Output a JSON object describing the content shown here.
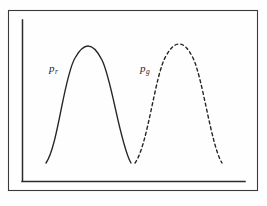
{
  "figure": {
    "background_color": "#fefefe",
    "stroke_color": "#262626",
    "frame_color": "#3a3a3a",
    "axis_color": "#2b2b2b",
    "width": 267,
    "height": 206
  },
  "labels": {
    "p_real": {
      "base": "p",
      "subscript": "r",
      "full": "pr"
    },
    "p_generated": {
      "base": "p",
      "subscript": "g",
      "full": "pg"
    }
  },
  "chart_data": {
    "type": "line",
    "title": "",
    "xlabel": "",
    "ylabel": "",
    "grid": false,
    "legend_position": "inline-annotation",
    "xlim": [
      0,
      267
    ],
    "ylim": [
      0,
      206
    ],
    "axes": {
      "y_axis": {
        "x": 22,
        "y_top": 20,
        "y_bottom": 181
      },
      "x_axis": {
        "y": 181,
        "x_left": 22,
        "x_right": 245
      },
      "outer_frame": {
        "x": 8,
        "y": 10,
        "width": 249,
        "height": 180
      }
    },
    "series": [
      {
        "name": "pr",
        "label": "pr",
        "style": "solid",
        "color": "#262626",
        "linewidth": 1.4,
        "baseline_y": 163,
        "peak": {
          "x": 88,
          "y": 49
        },
        "start": {
          "x": 46,
          "y": 163
        },
        "end": {
          "x": 131,
          "y": 163
        },
        "path": "M 46 163 C 58 146 64 76 75 58 C 80 49 84 46 88 46 C 93 46 97 50 102 60 C 112 80 120 144 131 163"
      },
      {
        "name": "pg",
        "label": "pg",
        "style": "dashed",
        "color": "#262626",
        "linewidth": 1.4,
        "dash_pattern": "3 3",
        "baseline_y": 163,
        "peak": {
          "x": 178,
          "y": 47
        },
        "start": {
          "x": 135,
          "y": 163
        },
        "end": {
          "x": 222,
          "y": 163
        },
        "path": "M 135 163 C 148 145 155 74 166 56 C 171 47 175 44 179 44 C 184 44 188 48 193 58 C 203 79 211 145 222 163"
      }
    ],
    "annotations": [
      {
        "text": "pr",
        "x": 49,
        "y": 70,
        "style": "italic-with-subscript"
      },
      {
        "text": "pg",
        "x": 140,
        "y": 70,
        "style": "italic-with-subscript"
      }
    ]
  }
}
